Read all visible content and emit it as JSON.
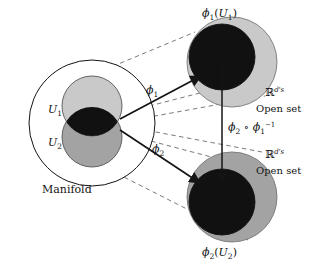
{
  "figure": {
    "background_color": "#ffffff",
    "stroke_color": "#141414"
  },
  "colors": {
    "manifold_fill": "#ffffff",
    "u1_fill": "#c9c9c9",
    "u2_fill": "#a3a3a3",
    "overlap_fill": "#111111",
    "chart1_outer_fill": "#c9c9c9",
    "chart1_inner_fill": "#111111",
    "chart2_outer_fill": "#a3a3a3",
    "chart2_inner_fill": "#111111",
    "line": "#141414",
    "dashed_line": "#6b6b6b"
  },
  "labels": {
    "manifold": "Manifold",
    "u1": "U",
    "u1_sub": "1",
    "u2": "U",
    "u2_sub": "2",
    "phi1": "ϕ",
    "phi1_sub": "1",
    "phi2": "ϕ",
    "phi2_sub": "2",
    "chart1_image_phi": "ϕ",
    "chart1_image_sub": "1",
    "chart1_image_open": "(",
    "chart1_image_u": "U",
    "chart1_image_usub": "1",
    "chart1_image_close": ")",
    "chart2_image_phi": "ϕ",
    "chart2_image_sub": "2",
    "chart2_image_open": "(",
    "chart2_image_u": "U",
    "chart2_image_usub": "2",
    "chart2_image_close": ")",
    "transition_phi2": "ϕ",
    "transition_phi2_sub": "2",
    "transition_circ": "∘",
    "transition_phi1": "ϕ",
    "transition_phi1_sub": "1",
    "transition_phi1_sup": "−1",
    "rd_symbol_top": "ℝ",
    "rd_exp_top": "d's",
    "open_set_top": "Open set",
    "rd_symbol_bottom": "ℝ",
    "rd_exp_bottom": "d's",
    "open_set_bottom": "Open set"
  },
  "geometry": {
    "manifold_circle": {
      "cx": 92,
      "cy": 123,
      "r": 63
    },
    "u1_circle": {
      "cx": 92,
      "cy": 106,
      "r": 30
    },
    "u2_circle": {
      "cx": 92,
      "cy": 137,
      "r": 30
    },
    "chart1_outer": {
      "cx": 232,
      "cy": 62,
      "r": 45
    },
    "chart1_inner": {
      "cx": 222,
      "cy": 57,
      "r": 33
    },
    "chart2_outer": {
      "cx": 232,
      "cy": 197,
      "r": 45
    },
    "chart2_inner": {
      "cx": 222,
      "cy": 202,
      "r": 33
    }
  }
}
